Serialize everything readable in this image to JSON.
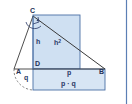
{
  "figure": {
    "colors": {
      "fill_square": "#cfe0f2",
      "fill_rect": "#d7e5f4",
      "stroke_shape": "#4a6fa5",
      "stroke_line": "#3a3a3a",
      "label": "#2b3a67",
      "right_strip": "#5b7fb5",
      "background": "#ffffff"
    },
    "points": [
      {
        "name": "A",
        "label": "A",
        "x": 16,
        "y": 71
      },
      {
        "name": "B",
        "label": "B",
        "x": 100,
        "y": 71
      },
      {
        "name": "C",
        "label": "C",
        "x": 32,
        "y": 13
      },
      {
        "name": "D",
        "label": "D",
        "x": 36,
        "y": 64
      }
    ],
    "segment_labels": [
      {
        "name": "altitude-h",
        "label": "h",
        "x": 37,
        "y": 43
      },
      {
        "name": "square-area",
        "label": "h",
        "sup": "2",
        "x": 55,
        "y": 44
      },
      {
        "name": "segment-q",
        "label": "q",
        "x": 25,
        "y": 78
      },
      {
        "name": "segment-p",
        "label": "p",
        "x": 68,
        "y": 73
      },
      {
        "name": "rect-area",
        "label": "p · q",
        "x": 62,
        "y": 84
      }
    ],
    "shapes": {
      "square": {
        "x": 33,
        "y": 15,
        "w": 47,
        "h": 54
      },
      "rectangle": {
        "x": 33,
        "y": 69,
        "w": 72,
        "h": 21
      },
      "triangle": "A(14,69) B(105,69) C(33,16)",
      "altitude": "C(33,16) to D(33,69)",
      "arc": "dashed arc from A(14,69) sweeping down-right",
      "right_angle_marker": "at C"
    }
  }
}
